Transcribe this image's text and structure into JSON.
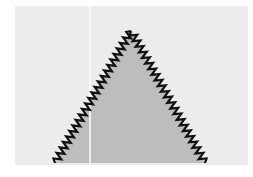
{
  "diagram": {
    "colors": {
      "page_background": "#ffffff",
      "panel_background": "#ececec",
      "triangle_fill": "#bdbdbd",
      "edge_stroke": "#111111",
      "divider_line": "#ffffff"
    },
    "panel": {
      "x": 15,
      "y": 6,
      "width": 233,
      "height": 159
    },
    "divider": {
      "x": 90,
      "y1": 6,
      "y2": 165
    },
    "triangle": {
      "apex": [
        131,
        31
      ],
      "base_left": [
        55,
        163
      ],
      "base_right": [
        205,
        163
      ]
    },
    "edge_pattern": "zigzag",
    "label": ""
  }
}
